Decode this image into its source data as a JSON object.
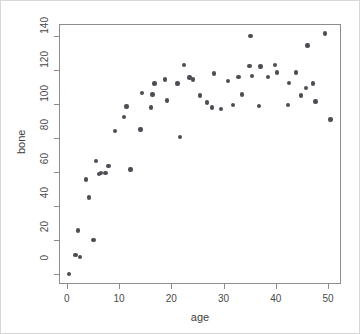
{
  "figure": {
    "background_color": "#ffffff",
    "frame_color": "#8c8c8c",
    "point_color": "#4d4d55",
    "xlabel": "age",
    "ylabel": "bone"
  },
  "chart_data": {
    "type": "scatter",
    "title": "",
    "xlabel": "age",
    "ylabel": "bone",
    "xlim": [
      -1.5,
      52.5
    ],
    "ylim": [
      -6,
      147
    ],
    "xticks": [
      0,
      10,
      20,
      30,
      40,
      50
    ],
    "yticks": [
      0,
      20,
      40,
      60,
      80,
      100,
      120,
      140
    ],
    "xticklabels": [
      "0",
      "10",
      "20",
      "30",
      "40",
      "50"
    ],
    "yticklabels": [
      "0",
      "20",
      "40",
      "60",
      "80",
      "100",
      "120",
      "140"
    ],
    "grid": false,
    "legend": null,
    "marker": "filled-circle",
    "marker_color": "#4d4d55",
    "marker_size": 4.4,
    "n_points": 70,
    "points": [
      {
        "x": 0.2,
        "y": 0.5
      },
      {
        "x": 1.5,
        "y": 11.5
      },
      {
        "x": 2.0,
        "y": 26.0
      },
      {
        "x": 2.3,
        "y": 10.5
      },
      {
        "x": 3.5,
        "y": 56.0
      },
      {
        "x": 4.1,
        "y": 45.5
      },
      {
        "x": 4.9,
        "y": 20.5
      },
      {
        "x": 5.4,
        "y": 67.0
      },
      {
        "x": 6.0,
        "y": 59.5
      },
      {
        "x": 6.4,
        "y": 60.0
      },
      {
        "x": 7.2,
        "y": 60.0
      },
      {
        "x": 7.8,
        "y": 64.0
      },
      {
        "x": 9.0,
        "y": 84.5
      },
      {
        "x": 10.8,
        "y": 93.0
      },
      {
        "x": 11.2,
        "y": 99.0
      },
      {
        "x": 12.0,
        "y": 62.0
      },
      {
        "x": 13.9,
        "y": 85.5
      },
      {
        "x": 14.2,
        "y": 107.0
      },
      {
        "x": 15.9,
        "y": 98.5
      },
      {
        "x": 16.2,
        "y": 106.0
      },
      {
        "x": 16.6,
        "y": 112.5
      },
      {
        "x": 18.6,
        "y": 115.0
      },
      {
        "x": 19.0,
        "y": 102.5
      },
      {
        "x": 21.0,
        "y": 112.5
      },
      {
        "x": 21.5,
        "y": 81.0
      },
      {
        "x": 22.2,
        "y": 123.5
      },
      {
        "x": 23.3,
        "y": 116.0
      },
      {
        "x": 24.0,
        "y": 115.0
      },
      {
        "x": 25.3,
        "y": 105.5
      },
      {
        "x": 26.6,
        "y": 101.5
      },
      {
        "x": 27.6,
        "y": 98.5
      },
      {
        "x": 28.0,
        "y": 118.5
      },
      {
        "x": 29.3,
        "y": 97.5
      },
      {
        "x": 30.7,
        "y": 114.0
      },
      {
        "x": 31.6,
        "y": 100.0
      },
      {
        "x": 32.7,
        "y": 116.5
      },
      {
        "x": 33.4,
        "y": 106.0
      },
      {
        "x": 34.8,
        "y": 123.0
      },
      {
        "x": 35.0,
        "y": 140.5
      },
      {
        "x": 35.3,
        "y": 117.0
      },
      {
        "x": 36.6,
        "y": 99.5
      },
      {
        "x": 36.9,
        "y": 122.5
      },
      {
        "x": 38.3,
        "y": 116.5
      },
      {
        "x": 39.7,
        "y": 123.5
      },
      {
        "x": 40.1,
        "y": 119.0
      },
      {
        "x": 42.2,
        "y": 100.0
      },
      {
        "x": 42.4,
        "y": 113.0
      },
      {
        "x": 43.7,
        "y": 119.0
      },
      {
        "x": 44.6,
        "y": 105.5
      },
      {
        "x": 45.6,
        "y": 110.0
      },
      {
        "x": 45.9,
        "y": 135.0
      },
      {
        "x": 47.0,
        "y": 112.5
      },
      {
        "x": 47.4,
        "y": 102.0
      },
      {
        "x": 49.2,
        "y": 142.0
      },
      {
        "x": 50.3,
        "y": 91.5
      }
    ]
  }
}
